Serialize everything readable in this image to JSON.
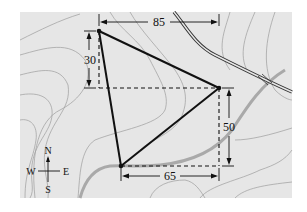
{
  "diagram": {
    "type": "triangle-on-topographic-map",
    "background_color": "#e6e6e6",
    "contour_color": "#9a9a9a",
    "road_color": "#333333",
    "river_color": "#a8a8a8",
    "line_color": "#111111",
    "vertices": {
      "A": {
        "x": 99,
        "y": 31
      },
      "B": {
        "x": 219,
        "y": 88
      },
      "C": {
        "x": 121,
        "y": 166
      }
    },
    "dimensions": {
      "top": {
        "label": "85"
      },
      "left": {
        "label": "30"
      },
      "right": {
        "label": "50"
      },
      "bottom": {
        "label": "65"
      }
    },
    "compass": {
      "north": "N",
      "south": "S",
      "east": "E",
      "west": "W"
    }
  }
}
